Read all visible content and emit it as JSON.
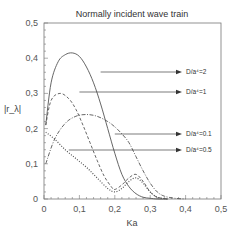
{
  "chart_data": {
    "type": "line",
    "title": "Normally incident wave train",
    "xlabel": "Ka",
    "ylabel": "|r_λ|",
    "xlim": [
      0,
      0.5
    ],
    "ylim": [
      0,
      0.5
    ],
    "xticks": [
      "0",
      "0.1",
      "0.2",
      "0.3",
      "0.4",
      "0.5"
    ],
    "yticks": [
      "0",
      "0.1",
      "0.2",
      "0.3",
      "0.4",
      "0.5"
    ],
    "grid": false,
    "legend_position": "right, arrow-annotated",
    "series": [
      {
        "name": "D/a⁴=2",
        "style": "solid",
        "x": [
          0.005,
          0.02,
          0.04,
          0.06,
          0.08,
          0.1,
          0.12,
          0.14,
          0.16,
          0.18,
          0.2,
          0.22,
          0.24,
          0.26,
          0.28,
          0.3,
          0.32,
          0.35
        ],
        "y": [
          0.21,
          0.33,
          0.39,
          0.41,
          0.415,
          0.405,
          0.375,
          0.33,
          0.27,
          0.2,
          0.13,
          0.07,
          0.035,
          0.015,
          0.005,
          0.002,
          0.0,
          0.0
        ],
        "label_anchor": {
          "x": 0.16,
          "y": 0.33
        }
      },
      {
        "name": "D/a⁴=1",
        "style": "dashed",
        "x": [
          0.005,
          0.02,
          0.045,
          0.07,
          0.09,
          0.11,
          0.13,
          0.15,
          0.17,
          0.19,
          0.2,
          0.22,
          0.24,
          0.26,
          0.28,
          0.3,
          0.32,
          0.35
        ],
        "y": [
          0.21,
          0.28,
          0.3,
          0.285,
          0.255,
          0.21,
          0.16,
          0.11,
          0.065,
          0.035,
          0.027,
          0.04,
          0.06,
          0.07,
          0.05,
          0.02,
          0.005,
          0.0
        ],
        "label_anchor": {
          "x": 0.1,
          "y": 0.27
        }
      },
      {
        "name": "D/a⁴=0.1",
        "style": "dash-dot",
        "x": [
          0.005,
          0.03,
          0.06,
          0.09,
          0.12,
          0.15,
          0.18,
          0.2,
          0.22,
          0.24,
          0.26,
          0.28,
          0.3,
          0.32,
          0.34,
          0.37,
          0.4
        ],
        "y": [
          0.1,
          0.17,
          0.215,
          0.235,
          0.24,
          0.235,
          0.22,
          0.205,
          0.185,
          0.16,
          0.12,
          0.08,
          0.045,
          0.02,
          0.008,
          0.002,
          0.0
        ],
        "label_anchor": {
          "x": 0.2,
          "y": 0.2
        }
      },
      {
        "name": "D/a⁴=0.5",
        "style": "dotted",
        "x": [
          0.005,
          0.03,
          0.06,
          0.09,
          0.12,
          0.15,
          0.18,
          0.2,
          0.22,
          0.24,
          0.26,
          0.28,
          0.3,
          0.32,
          0.35
        ],
        "y": [
          0.19,
          0.17,
          0.14,
          0.115,
          0.09,
          0.06,
          0.03,
          0.02,
          0.03,
          0.05,
          0.06,
          0.045,
          0.02,
          0.005,
          0.0
        ],
        "label_anchor": {
          "x": 0.07,
          "y": 0.14
        }
      }
    ]
  }
}
